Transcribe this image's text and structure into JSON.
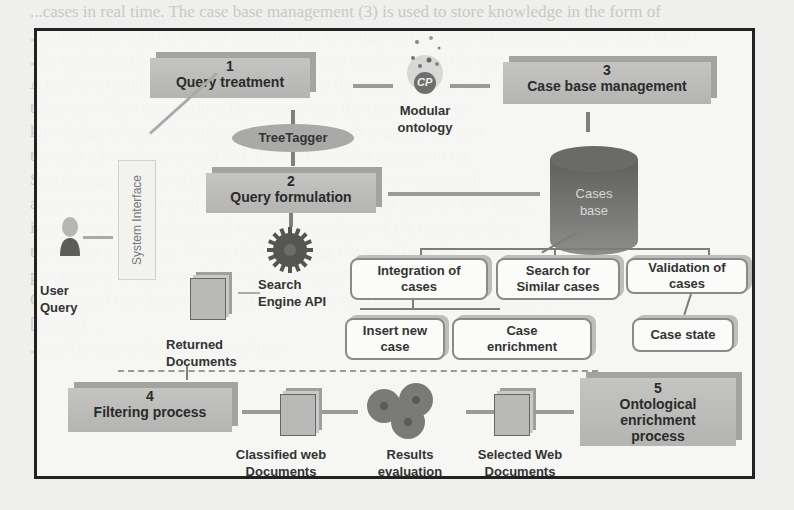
{
  "background_text": [
    "...cases in real time. The case base management (3) is used to store knowledge in the form of",
    "...reformulation (2) is carried out using the ontology and previous experiences, whose tools of text",
    "...is applied to the formulated query to process results and fill the case base.",
    "A problem resolution process plays a role in the existing cases, each one of which",
    "takes a problem description. The system uses the case base as its",
    "knowledge of cases formulated in a query, which is gradually used",
    "through a friendly system (ISR), the interface also stores it to the",
    "Search engine API sends results back to the user. Case storage and",
    "analysis are used to evaluate results of the system and to insert new cases,",
    "integration and enrichment of cases; the similarity of the cases are done",
    "the results to the user. We use the knowledge obtained from the",
    "processes of evaluation of the web documents to enrich the ontology and",
    "Ontological enrichment process (5) using the returned Web documents and a",
    "[Figure] ...",
    "...enrichment of the domain ontology..."
  ],
  "diagram": {
    "modules": {
      "query_treatment": {
        "num": "1",
        "label": "Query treatment"
      },
      "query_formulation": {
        "num": "2",
        "label": "Query formulation"
      },
      "case_base_management": {
        "num": "3",
        "label": "Case base management"
      },
      "filtering_process": {
        "num": "4",
        "label": "Filtering process"
      },
      "ontological_enrichment": {
        "num": "5",
        "label": "Ontological enrichment process"
      }
    },
    "tree_tagger": "TreeTagger",
    "modular_ontology": {
      "line1": "Modular",
      "line2": "ontology",
      "badge": "CP"
    },
    "system_interface": "System Interface",
    "user_query": {
      "line1": "User",
      "line2": "Query"
    },
    "search_engine_api": {
      "line1": "Search",
      "line2": "Engine API"
    },
    "returned_documents": {
      "line1": "Returned",
      "line2": "Documents"
    },
    "cases_base": {
      "line1": "Cases",
      "line2": "base"
    },
    "case_ops": {
      "integration": {
        "line1": "Integration of",
        "line2": "cases"
      },
      "search_similar": {
        "line1": "Search for",
        "line2": "Similar cases"
      },
      "validation": {
        "line1": "Validation of",
        "line2": "cases"
      },
      "insert_new": {
        "line1": "Insert new",
        "line2": "case"
      },
      "enrichment": {
        "line1": "Case",
        "line2": "enrichment"
      },
      "case_state": {
        "line1": "Case state"
      }
    },
    "classified_web_documents": {
      "line1": "Classified web",
      "line2": "Documents"
    },
    "results_evaluation": {
      "line1": "Results",
      "line2": "evaluation"
    },
    "selected_web_documents": {
      "line1": "Selected Web",
      "line2": "Documents"
    }
  }
}
